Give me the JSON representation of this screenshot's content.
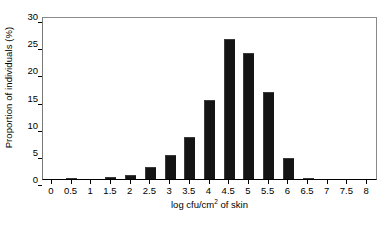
{
  "chart_data": {
    "type": "bar",
    "title": "",
    "xlabel_prefix": "log cfu/cm",
    "xlabel_superscript": "2",
    "xlabel_suffix": " of skin",
    "xlabel": "log cfu/cm2 of skin",
    "ylabel": "Proportion of individuals (%)",
    "categories": [
      "0",
      "0.5",
      "1",
      "1.5",
      "2",
      "2.5",
      "3",
      "3.5",
      "4",
      "4.5",
      "5",
      "5.5",
      "6",
      "6.5",
      "7",
      "7.5",
      "8"
    ],
    "values": [
      0,
      0.1,
      0,
      0.3,
      0.7,
      2.3,
      4.4,
      7.7,
      14.5,
      25.7,
      23.2,
      16.0,
      3.8,
      0.1,
      0,
      0,
      0
    ],
    "ylim": [
      0,
      30
    ],
    "yticks": [
      0,
      5,
      10,
      15,
      20,
      25,
      30
    ],
    "ytick_labels": [
      "0",
      "5",
      "10",
      "15",
      "20",
      "25",
      "30"
    ],
    "xlim": [
      0,
      8
    ],
    "grid": false,
    "legend": null,
    "bar_color": "#141414",
    "frame_color": "#8a8a8a",
    "background": "#ffffff"
  }
}
